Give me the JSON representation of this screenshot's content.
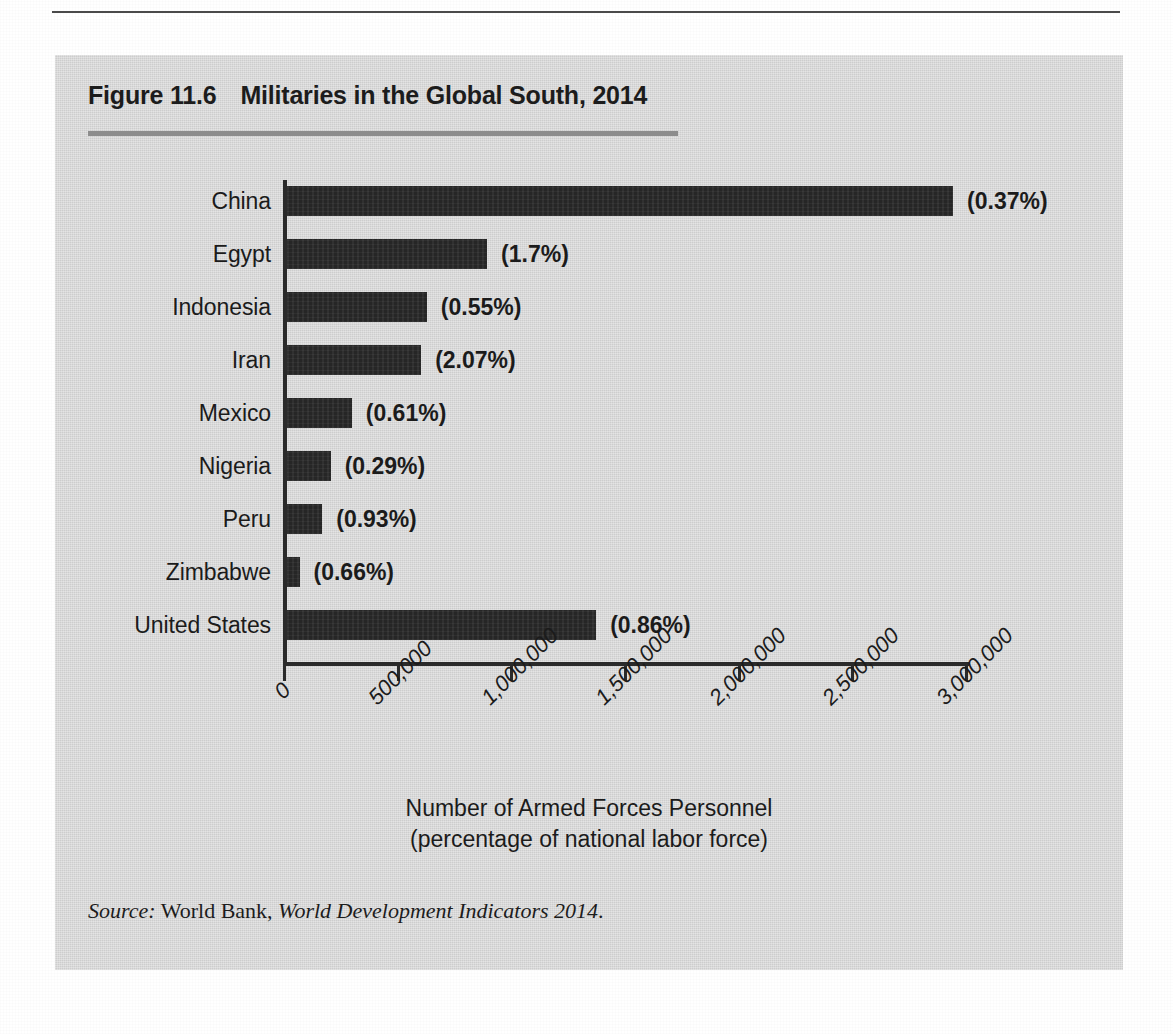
{
  "figure": {
    "number": "Figure 11.6",
    "title": "Militaries in the Global South, 2014"
  },
  "source": {
    "label": "Source:",
    "publisher": "World Bank,",
    "work": "World Development Indicators 2014",
    "terminator": "."
  },
  "colors": {
    "panel_background": "#d5d5d5",
    "bar": "#262626",
    "axis": "#2a2a2a",
    "title_rule": "#8d8d8d",
    "text": "#1b1b1b"
  },
  "chart_data": {
    "type": "bar",
    "orientation": "horizontal",
    "title": "Militaries in the Global South, 2014",
    "xlabel": "Number of Armed Forces Personnel (percentage of national labor force)",
    "xlabel_line1": "Number of Armed Forces Personnel",
    "xlabel_line2": "(percentage of national labor force)",
    "ylabel": "",
    "xlim": [
      0,
      3000000
    ],
    "grid": false,
    "legend": false,
    "tick_labels": [
      "0",
      "500,000",
      "1,000,000",
      "1,500,000",
      "2,000,000",
      "2,500,000",
      "3,000,000"
    ],
    "tick_values": [
      0,
      500000,
      1000000,
      1500000,
      2000000,
      2500000,
      3000000
    ],
    "categories": [
      "China",
      "Egypt",
      "Indonesia",
      "Iran",
      "Mexico",
      "Nigeria",
      "Peru",
      "Zimbabwe",
      "United States"
    ],
    "values": [
      2930000,
      880000,
      615000,
      590000,
      285000,
      192000,
      155000,
      55000,
      1360000
    ],
    "data_labels": [
      "(0.37%)",
      "(1.7%)",
      "(0.55%)",
      "(2.07%)",
      "(0.61%)",
      "(0.29%)",
      "(0.93%)",
      "(0.66%)",
      "(0.86%)"
    ],
    "percent_of_labor_force": [
      0.37,
      1.7,
      0.55,
      2.07,
      0.61,
      0.29,
      0.93,
      0.66,
      0.86
    ],
    "bars": [
      {
        "category": "China",
        "value": 2930000,
        "label": "(0.37%)",
        "percent": 0.37
      },
      {
        "category": "Egypt",
        "value": 880000,
        "label": "(1.7%)",
        "percent": 1.7
      },
      {
        "category": "Indonesia",
        "value": 615000,
        "label": "(0.55%)",
        "percent": 0.55
      },
      {
        "category": "Iran",
        "value": 590000,
        "label": "(2.07%)",
        "percent": 2.07
      },
      {
        "category": "Mexico",
        "value": 285000,
        "label": "(0.61%)",
        "percent": 0.61
      },
      {
        "category": "Nigeria",
        "value": 192000,
        "label": "(0.29%)",
        "percent": 0.29
      },
      {
        "category": "Peru",
        "value": 155000,
        "label": "(0.93%)",
        "percent": 0.93
      },
      {
        "category": "Zimbabwe",
        "value": 55000,
        "label": "(0.66%)",
        "percent": 0.66
      },
      {
        "category": "United States",
        "value": 1360000,
        "label": "(0.86%)",
        "percent": 0.86
      }
    ]
  },
  "ghost_text": [
    "",
    "",
    "",
    "",
    "",
    "",
    "",
    "",
    "",
    "",
    "",
    "",
    "",
    "",
    "",
    "",
    "",
    "",
    "",
    "",
    "",
    "",
    "",
    "",
    "",
    "",
    "",
    "",
    ""
  ]
}
